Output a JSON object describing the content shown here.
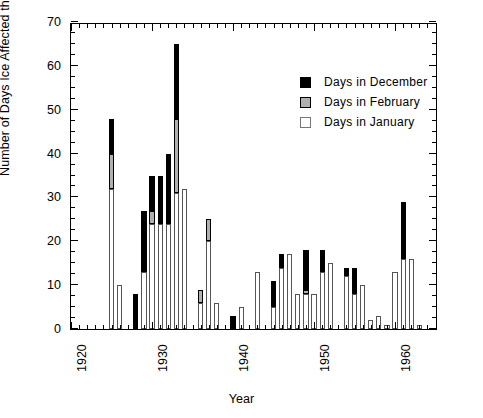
{
  "chart_data": {
    "type": "bar",
    "stacked": true,
    "title": "",
    "xlabel": "Year",
    "ylabel": "Number of Days Ice Affected the Gaging Station",
    "xlim": [
      1920,
      1965.3
    ],
    "ylim": [
      0,
      70
    ],
    "ytick_labels": [
      "0",
      "10",
      "20",
      "30",
      "40",
      "50",
      "60",
      "70"
    ],
    "ytick_values": [
      0,
      10,
      20,
      30,
      40,
      50,
      60,
      70
    ],
    "ytick_minor_step": 2.5,
    "xtick_labels": [
      "1920",
      "1930",
      "1940",
      "1950",
      "1960"
    ],
    "xtick_values": [
      1920,
      1930,
      1940,
      1950,
      1960
    ],
    "xtick_minor_step": 1,
    "grid": false,
    "legend_position": "upper-right-inside",
    "series": [
      {
        "name": "Days in January",
        "color": "#ffffff",
        "key": "jan"
      },
      {
        "name": "Days in February",
        "color": "#b0b0b0",
        "key": "feb"
      },
      {
        "name": "Days in December",
        "color": "#000000",
        "key": "dec"
      }
    ],
    "categories": [
      1925,
      1926,
      1928,
      1929,
      1930,
      1931,
      1932,
      1933,
      1934,
      1936,
      1937,
      1938,
      1939,
      1940,
      1941,
      1943,
      1944,
      1945,
      1946,
      1947,
      1948,
      1949,
      1950,
      1951,
      1952,
      1954,
      1955,
      1956,
      1957,
      1958,
      1959,
      1960,
      1961,
      1962,
      1963
    ],
    "values": {
      "jan": [
        32,
        10,
        0,
        13,
        24,
        24,
        24,
        31,
        32,
        6,
        20,
        6,
        0,
        0,
        5,
        13,
        0,
        5,
        14,
        17,
        8,
        8,
        8,
        13,
        15,
        12,
        8,
        10,
        2,
        3,
        1,
        13,
        16,
        16,
        0
      ],
      "feb": [
        8,
        0,
        0,
        0,
        3,
        0,
        0,
        17,
        0,
        3,
        5,
        0,
        0,
        0,
        0,
        0,
        0,
        0,
        0,
        0,
        0,
        1,
        0,
        0,
        0,
        0,
        0,
        0,
        0,
        0,
        0,
        0,
        0,
        0,
        0
      ],
      "dec": [
        8,
        0,
        8,
        14,
        8,
        11,
        16,
        17,
        0,
        0,
        0,
        0,
        0,
        3,
        0,
        0,
        0,
        6,
        3,
        0,
        0,
        9,
        0,
        5,
        0,
        2,
        6,
        0,
        0,
        0,
        0,
        0,
        13,
        0,
        0
      ]
    },
    "bars": [
      {
        "year": 1925,
        "jan": 32,
        "feb": 8,
        "dec": 8,
        "total": 48
      },
      {
        "year": 1926,
        "jan": 10,
        "feb": 0,
        "dec": 0,
        "total": 10
      },
      {
        "year": 1928,
        "jan": 0,
        "feb": 0,
        "dec": 8,
        "total": 8
      },
      {
        "year": 1929,
        "jan": 13,
        "feb": 0,
        "dec": 14,
        "total": 27
      },
      {
        "year": 1930,
        "jan": 24,
        "feb": 3,
        "dec": 8,
        "total": 35
      },
      {
        "year": 1931,
        "jan": 24,
        "feb": 0,
        "dec": 11,
        "total": 35
      },
      {
        "year": 1932,
        "jan": 24,
        "feb": 0,
        "dec": 16,
        "total": 40
      },
      {
        "year": 1933,
        "jan": 31,
        "feb": 17,
        "dec": 17,
        "total": 65
      },
      {
        "year": 1934,
        "jan": 32,
        "feb": 0,
        "dec": 0,
        "total": 32
      },
      {
        "year": 1936,
        "jan": 6,
        "feb": 3,
        "dec": 0,
        "total": 9
      },
      {
        "year": 1937,
        "jan": 20,
        "feb": 5,
        "dec": 0,
        "total": 25
      },
      {
        "year": 1938,
        "jan": 6,
        "feb": 0,
        "dec": 0,
        "total": 6
      },
      {
        "year": 1940,
        "jan": 0,
        "feb": 0,
        "dec": 3,
        "total": 3
      },
      {
        "year": 1941,
        "jan": 5,
        "feb": 0,
        "dec": 0,
        "total": 5
      },
      {
        "year": 1943,
        "jan": 13,
        "feb": 0,
        "dec": 0,
        "total": 13
      },
      {
        "year": 1945,
        "jan": 5,
        "feb": 0,
        "dec": 6,
        "total": 11
      },
      {
        "year": 1946,
        "jan": 14,
        "feb": 0,
        "dec": 3,
        "total": 17
      },
      {
        "year": 1947,
        "jan": 17,
        "feb": 0,
        "dec": 0,
        "total": 17
      },
      {
        "year": 1948,
        "jan": 8,
        "feb": 0,
        "dec": 0,
        "total": 8
      },
      {
        "year": 1949,
        "jan": 8,
        "feb": 1,
        "dec": 9,
        "total": 18
      },
      {
        "year": 1950,
        "jan": 8,
        "feb": 0,
        "dec": 0,
        "total": 8
      },
      {
        "year": 1951,
        "jan": 13,
        "feb": 0,
        "dec": 5,
        "total": 18
      },
      {
        "year": 1952,
        "jan": 15,
        "feb": 0,
        "dec": 0,
        "total": 15
      },
      {
        "year": 1954,
        "jan": 12,
        "feb": 0,
        "dec": 2,
        "total": 14
      },
      {
        "year": 1955,
        "jan": 8,
        "feb": 0,
        "dec": 6,
        "total": 14
      },
      {
        "year": 1956,
        "jan": 10,
        "feb": 0,
        "dec": 0,
        "total": 10
      },
      {
        "year": 1957,
        "jan": 2,
        "feb": 0,
        "dec": 0,
        "total": 2
      },
      {
        "year": 1958,
        "jan": 3,
        "feb": 0,
        "dec": 0,
        "total": 3
      },
      {
        "year": 1959,
        "jan": 1,
        "feb": 0,
        "dec": 0,
        "total": 1
      },
      {
        "year": 1960,
        "jan": 13,
        "feb": 0,
        "dec": 0,
        "total": 13
      },
      {
        "year": 1961,
        "jan": 16,
        "feb": 0,
        "dec": 13,
        "total": 29
      },
      {
        "year": 1962,
        "jan": 16,
        "feb": 0,
        "dec": 0,
        "total": 16
      },
      {
        "year": 1963,
        "jan": 1,
        "feb": 0,
        "dec": 0,
        "total": 1
      }
    ]
  },
  "legend": {
    "items": [
      {
        "label": "Days in December",
        "key": "dec"
      },
      {
        "label": "Days in February",
        "key": "feb"
      },
      {
        "label": "Days in January",
        "key": "jan"
      }
    ]
  },
  "axes": {
    "x_title": "Year",
    "y_title": "Number of Days Ice Affected the Gaging Station"
  }
}
